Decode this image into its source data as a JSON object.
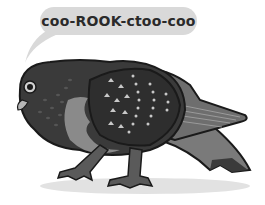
{
  "illustration": {
    "subject": "pigeon",
    "speech_bubble": {
      "text": "coo-ROOK-ctoo-coo"
    },
    "colors": {
      "background": "#ffffff",
      "bubble": "#d9d9d9",
      "body_dark": "#3a3a3a",
      "body_mid": "#5a5a5a",
      "breast": "#8a8a8a",
      "outline": "#1a1a1a",
      "spots": "#c8c8c8",
      "shadow": "#e2e2e2"
    }
  }
}
